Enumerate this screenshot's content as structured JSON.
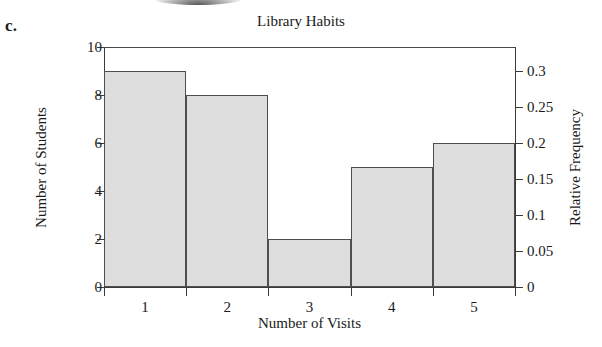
{
  "part_label": "c.",
  "chart_data": {
    "type": "bar",
    "title": "Library Habits",
    "xlabel": "Number of Visits",
    "ylabel": "Number of Students",
    "ylabel_secondary": "Relative Frequency",
    "categories": [
      "1",
      "2",
      "3",
      "4",
      "5"
    ],
    "values": [
      9,
      8,
      2,
      5,
      6
    ],
    "relative_frequency": [
      0.3,
      0.2667,
      0.0667,
      0.1667,
      0.2
    ],
    "ylim": [
      0,
      10
    ],
    "ylim_secondary": [
      0,
      0.3333
    ],
    "yticks": [
      0,
      2,
      4,
      6,
      8,
      10
    ],
    "ytick_labels": [
      "0",
      "2",
      "4",
      "6",
      "8",
      "10"
    ],
    "yticks_secondary": [
      0,
      0.05,
      0.1,
      0.15,
      0.2,
      0.25,
      0.3
    ],
    "ytick_labels_secondary": [
      "0",
      "0.05",
      "0.1",
      "0.15",
      "0.2",
      "0.25",
      "0.3"
    ],
    "xtick_labels": [
      "1",
      "2",
      "3",
      "4",
      "5"
    ],
    "grid": false,
    "legend": null,
    "bar_fill": "#dedede",
    "bar_edge": "#4f4f4f",
    "total_students": 30
  }
}
